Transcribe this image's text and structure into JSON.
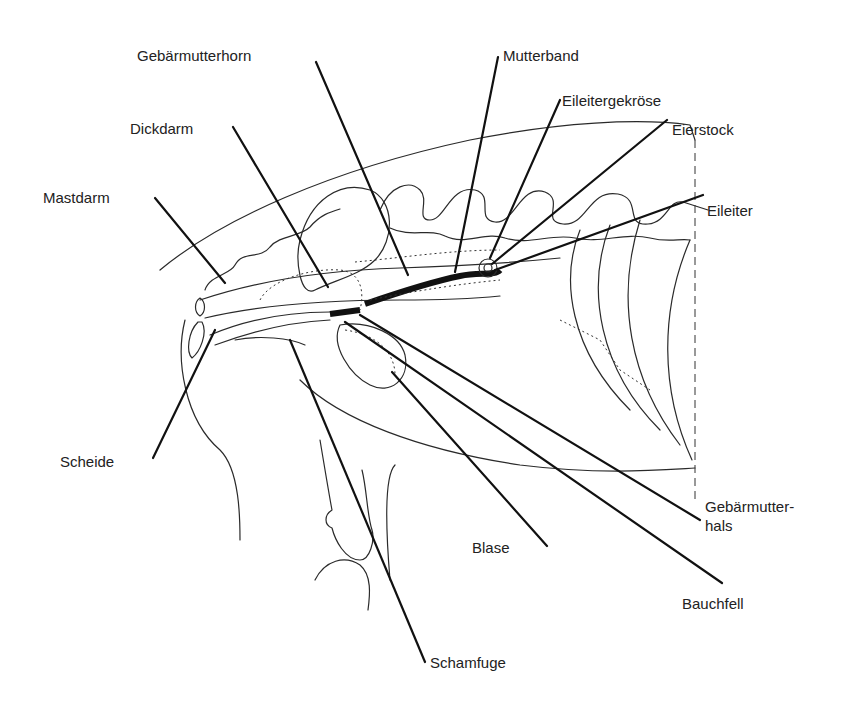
{
  "figure": {
    "labels": {
      "gebaermutterhorn": "Gebärmutterhorn",
      "mutterband": "Mutterband",
      "eileitergekroese": "Eileitergekröse",
      "eierstock": "Eierstock",
      "dickdarm": "Dickdarm",
      "mastdarm": "Mastdarm",
      "eileiter": "Eileiter",
      "scheide": "Scheide",
      "gebaermutterhals_line1": "Gebärmutter-",
      "gebaermutterhals_line2": "hals",
      "blase": "Blase",
      "bauchfell": "Bauchfell",
      "schamfuge": "Schamfuge"
    }
  }
}
